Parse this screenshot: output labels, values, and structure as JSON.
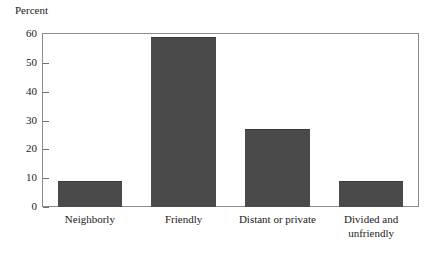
{
  "chart_data": {
    "type": "bar",
    "title": "",
    "subtitle": "",
    "ylabel": "Percent",
    "xlabel": "",
    "categories": [
      "Neighborly",
      "Friendly",
      "Distant or private",
      "Divided and unfriendly"
    ],
    "category_lines": [
      [
        "Neighborly"
      ],
      [
        "Friendly"
      ],
      [
        "Distant or private"
      ],
      [
        "Divided and",
        "unfriendly"
      ]
    ],
    "values": [
      9,
      59,
      27,
      9
    ],
    "ylim": [
      0,
      60
    ],
    "yticks": [
      0,
      10,
      20,
      30,
      40,
      50,
      60
    ],
    "ytick_labels": [
      "0",
      "10",
      "20",
      "30",
      "40",
      "50",
      "60"
    ],
    "grid": false,
    "legend": false,
    "legend_position": "none",
    "bar_color": "#4a4a4a",
    "frame_color": "#8c8c8c",
    "background": "#ffffff"
  }
}
